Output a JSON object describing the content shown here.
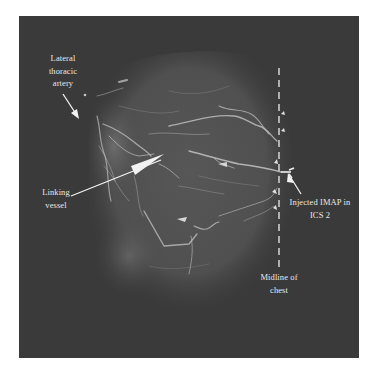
{
  "figure": {
    "colors": {
      "background": "#ffffff",
      "panel": "#3a3a3a",
      "tissue_glow": "#6a6a6a",
      "vessel": "#c8c8c8",
      "annotation": "#ececec"
    }
  },
  "annotations": {
    "lateral_thoracic": "Lateral\nthoracic\nartery",
    "linking_vessel": "Linking\nvessel",
    "injected_imap": "Injected IMAP in\nICS 2",
    "midline": "Midline of\nchest"
  }
}
